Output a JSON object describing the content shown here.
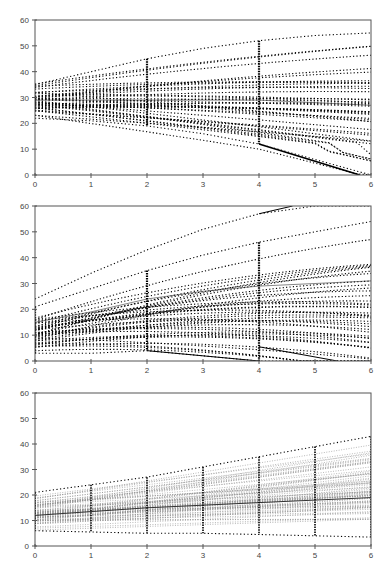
{
  "chart_data": [
    {
      "type": "line",
      "title": "",
      "xlabel": "",
      "ylabel": "",
      "xlim": [
        0,
        6
      ],
      "ylim": [
        0,
        60
      ],
      "x_ticks": [
        "0",
        "1",
        "2",
        "3",
        "4",
        "5",
        "6"
      ],
      "y_ticks": [
        "0",
        "10",
        "20",
        "30",
        "40",
        "50",
        "60"
      ],
      "grid": false,
      "legend": null,
      "style": "many dotted black individual trajectories, fanning out; bottom trajectories collapse to 0 near x=6",
      "x": [
        0,
        1,
        2,
        3,
        4,
        5,
        6
      ],
      "series": [
        {
          "name": "upper envelope",
          "values": [
            35,
            40,
            45,
            49,
            52,
            54,
            55
          ]
        },
        {
          "name": "mean",
          "values": [
            29,
            29,
            29,
            29,
            29,
            28,
            27
          ]
        },
        {
          "name": "lower envelope",
          "values": [
            22,
            21,
            19,
            16,
            12,
            6,
            0
          ]
        }
      ],
      "generator": {
        "n_lines": 40,
        "start_min": 22,
        "start_max": 36,
        "slope_min": -3.8,
        "slope_max": 3.6,
        "curve": -0.12,
        "floor_after": 4,
        "dense_columns": [
          2,
          4
        ]
      }
    },
    {
      "type": "line",
      "title": "",
      "xlabel": "",
      "ylabel": "",
      "xlim": [
        0,
        6
      ],
      "ylim": [
        0,
        60
      ],
      "x_ticks": [
        "0",
        "1",
        "2",
        "3",
        "4",
        "5",
        "6"
      ],
      "y_ticks": [
        "0",
        "10",
        "20",
        "30",
        "40",
        "50",
        "60"
      ],
      "grid": false,
      "legend": null,
      "style": "many dotted black individual trajectories, mostly increasing; one outlier reaching 60 near x=4.6",
      "x": [
        0,
        1,
        2,
        3,
        4,
        5,
        6
      ],
      "series": [
        {
          "name": "upper outlier",
          "values": [
            24,
            34,
            43,
            51,
            57,
            60,
            60
          ]
        },
        {
          "name": "upper envelope",
          "values": [
            21,
            28,
            35,
            41,
            46,
            50,
            54
          ]
        },
        {
          "name": "mean",
          "values": [
            15,
            19,
            24,
            27,
            29,
            30,
            31
          ]
        },
        {
          "name": "lower envelope",
          "values": [
            3,
            3,
            4,
            2,
            0,
            0,
            0
          ]
        }
      ],
      "generator": {
        "n_lines": 40,
        "start_min": 3,
        "start_max": 21,
        "slope_min": -0.8,
        "slope_max": 7.5,
        "curve": -0.35,
        "floor_after": 2,
        "dense_columns": [
          0,
          2,
          4
        ]
      }
    },
    {
      "type": "line",
      "title": "",
      "xlabel": "",
      "ylabel": "",
      "xlim": [
        0,
        6
      ],
      "ylim": [
        0,
        60
      ],
      "x_ticks": [
        "0",
        "1",
        "2",
        "3",
        "4",
        "5",
        "6"
      ],
      "y_ticks": [
        "0",
        "10",
        "20",
        "30",
        "40",
        "50",
        "60"
      ],
      "grid": false,
      "legend": null,
      "style": "many faint gray dotted straight trajectories with a solid darker mean line and vertical dotted spreads at each integer x",
      "x": [
        0,
        1,
        2,
        3,
        4,
        5,
        6
      ],
      "series": [
        {
          "name": "upper envelope",
          "values": [
            21,
            24,
            27,
            31,
            35,
            39,
            43
          ]
        },
        {
          "name": "mean",
          "values": [
            12,
            13.5,
            15,
            16,
            17,
            18,
            19
          ]
        },
        {
          "name": "lower envelope",
          "values": [
            6,
            5.5,
            5,
            5,
            4.5,
            4,
            3.5
          ]
        }
      ],
      "generator": {
        "n_lines": 70,
        "start_min": 5,
        "start_max": 21,
        "slope_min": -0.45,
        "slope_max": 3.7,
        "curve": 0,
        "floor_after": 99,
        "dense_columns": [
          0,
          1,
          2,
          3,
          4,
          5,
          6
        ]
      }
    }
  ],
  "layout": {
    "panels": [
      {
        "top": 0,
        "plot_top": 20,
        "plot_bottom": 175
      },
      {
        "top": 0,
        "plot_top": 206,
        "plot_bottom": 361
      },
      {
        "top": 0,
        "plot_top": 393,
        "plot_bottom": 546
      }
    ],
    "plot_left": 35,
    "plot_right": 371,
    "colors": {
      "axis": "#555555",
      "line_dark": "#000000",
      "line_faint": "#8a8a8a",
      "mean_line": "#333333"
    }
  }
}
